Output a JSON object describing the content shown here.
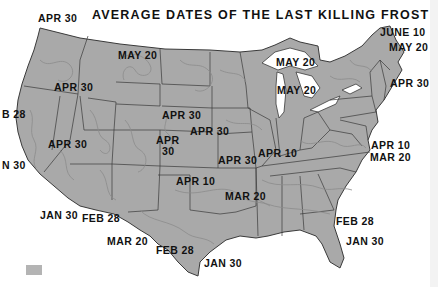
{
  "title": "AVERAGE DATES OF THE LAST KILLING FROST",
  "colors": {
    "land": "#a9a9a9",
    "border": "#3a3a3a",
    "contour": "#8e8e8e",
    "water": "#ffffff",
    "text": "#111111"
  },
  "labels": [
    {
      "text": "APR 30",
      "x": 38,
      "y": 13
    },
    {
      "text": "MAY 20",
      "x": 118,
      "y": 50
    },
    {
      "text": "APR 30",
      "x": 54,
      "y": 82
    },
    {
      "text": "B 28",
      "x": 2,
      "y": 109
    },
    {
      "text": "APR 30",
      "x": 48,
      "y": 139
    },
    {
      "text": "N 30",
      "x": 2,
      "y": 160
    },
    {
      "text": "APR 30",
      "x": 162,
      "y": 110
    },
    {
      "text": "APR",
      "x": 156,
      "y": 135
    },
    {
      "text": "30",
      "x": 162,
      "y": 146
    },
    {
      "text": "APR 30",
      "x": 190,
      "y": 126
    },
    {
      "text": "APR 30",
      "x": 218,
      "y": 155
    },
    {
      "text": "APR 10",
      "x": 258,
      "y": 148
    },
    {
      "text": "APR 10",
      "x": 176,
      "y": 176
    },
    {
      "text": "MAR 20",
      "x": 225,
      "y": 191
    },
    {
      "text": "JAN 30",
      "x": 40,
      "y": 210
    },
    {
      "text": "FEB 28",
      "x": 82,
      "y": 213
    },
    {
      "text": "MAR 20",
      "x": 107,
      "y": 236
    },
    {
      "text": "FEB 28",
      "x": 156,
      "y": 245
    },
    {
      "text": "JAN 30",
      "x": 204,
      "y": 258
    },
    {
      "text": "FEB 28",
      "x": 336,
      "y": 216
    },
    {
      "text": "JAN 30",
      "x": 346,
      "y": 236
    },
    {
      "text": "JUNE 10",
      "x": 380,
      "y": 27
    },
    {
      "text": "MAY 20",
      "x": 389,
      "y": 42
    },
    {
      "text": "MAY 20",
      "x": 276,
      "y": 57
    },
    {
      "text": "MAY 20",
      "x": 277,
      "y": 85
    },
    {
      "text": "APR 30",
      "x": 390,
      "y": 78
    },
    {
      "text": "APR 10",
      "x": 371,
      "y": 140
    },
    {
      "text": "MAR 20",
      "x": 370,
      "y": 152
    }
  ]
}
